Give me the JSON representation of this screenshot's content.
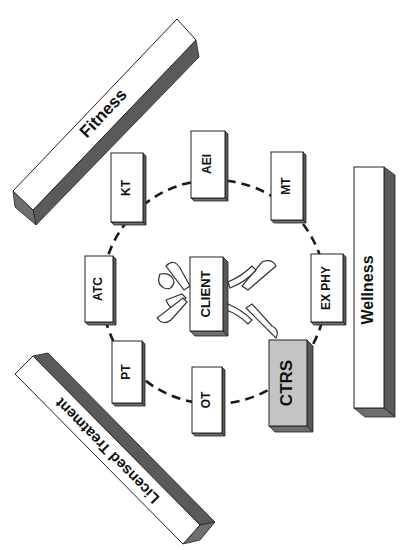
{
  "diagram": {
    "title": "",
    "center": {
      "label": "CLIENT",
      "has_figure": true
    },
    "ring_nodes": [
      {
        "id": "kt",
        "label": "KT",
        "style": "plain"
      },
      {
        "id": "aei",
        "label": "AEI",
        "style": "plain"
      },
      {
        "id": "mt",
        "label": "MT",
        "style": "plain"
      },
      {
        "id": "ex-phy",
        "label": "EX PHY",
        "style": "plain"
      },
      {
        "id": "ctrs",
        "label": "CTRS",
        "style": "shaded"
      },
      {
        "id": "ot",
        "label": "OT",
        "style": "plain"
      },
      {
        "id": "pt",
        "label": "PT",
        "style": "plain"
      },
      {
        "id": "atc",
        "label": "ATC",
        "style": "plain"
      }
    ],
    "categories": {
      "fitness": {
        "label": "Fitness"
      },
      "wellness": {
        "label": "Wellness"
      },
      "licensed": {
        "label": "Licensed Treatment"
      }
    },
    "connector": "dashed-circle",
    "colors": {
      "face": "#ffffff",
      "shaded_face": "#c4c4c4",
      "side": "#5a5a5a",
      "line": "#1a1a1a"
    }
  }
}
